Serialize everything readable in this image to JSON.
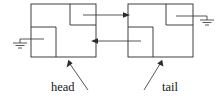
{
  "figure": {
    "type": "doubly-linked-list-diagram",
    "title": "",
    "background_color": "#ffffff",
    "line_color": "#2b2b2b",
    "text_color": "#141414",
    "width": 223,
    "height": 98
  },
  "nodes": [
    {
      "id": "head-node",
      "name": "head node",
      "box": {
        "x": 31,
        "y": 4,
        "w": 65,
        "h": 53
      },
      "compartments": [
        {
          "id": "head-node-next-pointer",
          "name": "next-pointer-cell",
          "x": 70,
          "y": 4,
          "w": 26,
          "h": 21,
          "pointer": "next",
          "target": "tail-node"
        },
        {
          "id": "head-node-prev-pointer",
          "name": "prev-pointer-cell",
          "x": 31,
          "y": 27,
          "w": 25,
          "h": 30,
          "pointer": "prev",
          "target": "null"
        }
      ]
    },
    {
      "id": "tail-node",
      "name": "tail node",
      "box": {
        "x": 128,
        "y": 4,
        "w": 65,
        "h": 53
      },
      "compartments": [
        {
          "id": "tail-node-next-pointer",
          "name": "next-pointer-cell",
          "x": 166,
          "y": 4,
          "w": 27,
          "h": 21,
          "pointer": "next",
          "target": "null"
        },
        {
          "id": "tail-node-prev-pointer",
          "name": "prev-pointer-cell",
          "x": 128,
          "y": 27,
          "w": 25,
          "h": 30,
          "pointer": "prev",
          "target": "head-node"
        }
      ]
    }
  ],
  "ground_symbols": [
    {
      "id": "left-null-ground",
      "name": "null-ground-symbol-left",
      "x": 13,
      "y": 39,
      "lead_from_x": 43,
      "lead_to_x": 13,
      "lead_y": 39,
      "meaning": "null"
    },
    {
      "id": "right-null-ground",
      "name": "null-ground-symbol-right",
      "x": 210,
      "y": 16,
      "lead_from_x": 178,
      "lead_to_x": 210,
      "lead_y": 16,
      "meaning": "null"
    }
  ],
  "arrows": [
    {
      "id": "next-arrow",
      "name": "next-pointer-arrow",
      "direction": "right",
      "from_x": 83,
      "from_y": 15,
      "to_x": 130,
      "to_y": 15,
      "description": "head.next points to tail node"
    },
    {
      "id": "prev-arrow",
      "name": "prev-pointer-arrow",
      "direction": "left",
      "from_x": 140,
      "from_y": 41,
      "to_x": 92,
      "to_y": 41,
      "description": "tail.prev points back to head node"
    }
  ],
  "labels": [
    {
      "id": "head-label",
      "name": "head-label",
      "text": "head",
      "text_x": 51,
      "text_y": 91,
      "leader": {
        "x1": 85,
        "y1": 89,
        "x2": 69,
        "y2": 62
      },
      "points_to": "head-node"
    },
    {
      "id": "tail-label",
      "name": "tail-label",
      "text": "tail",
      "text_x": 160,
      "text_y": 91,
      "leader": {
        "x1": 144,
        "y1": 89,
        "x2": 160,
        "y2": 62
      },
      "points_to": "tail-node"
    }
  ]
}
